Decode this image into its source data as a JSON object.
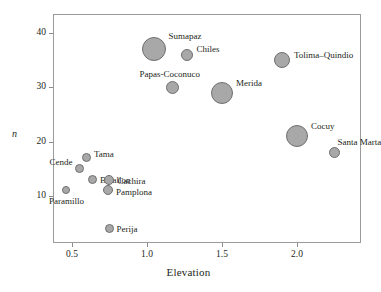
{
  "chart_data": {
    "type": "scatter",
    "title": "",
    "xlabel": "Elevation",
    "ylabel": "n",
    "xlim": [
      0.3734,
      2.4266
    ],
    "ylim": [
      1.3,
      43.5
    ],
    "xticks": [
      0.5,
      1.0,
      1.5,
      2.0
    ],
    "xtick_labels": [
      "0.5",
      "1.0",
      "1.5",
      "2.0"
    ],
    "yticks": [
      10,
      20,
      30,
      40
    ],
    "ytick_labels": [
      "10",
      "20",
      "30",
      "40"
    ],
    "grid": false,
    "legend": "none",
    "marker": "bubble",
    "size_encodes": "bubble area",
    "points": [
      {
        "label": "Sumapaz",
        "x": 1.05,
        "y": 37,
        "size": 24,
        "label_dx": 14,
        "label_dy": -17
      },
      {
        "label": "Chiles",
        "x": 1.27,
        "y": 36,
        "size": 12,
        "label_dx": 9,
        "label_dy": -10
      },
      {
        "label": "Papas-Coconuco",
        "x": 1.17,
        "y": 30,
        "size": 13,
        "label_dx": -33,
        "label_dy": -17
      },
      {
        "label": "Merida",
        "x": 1.5,
        "y": 29,
        "size": 22,
        "label_dx": 14,
        "label_dy": -14
      },
      {
        "label": "Tolima–Quindio",
        "x": 1.9,
        "y": 35,
        "size": 16,
        "label_dx": 12,
        "label_dy": -9
      },
      {
        "label": "Cocuy",
        "x": 2.0,
        "y": 21,
        "size": 22,
        "label_dx": 14,
        "label_dy": -14
      },
      {
        "label": "Santa Marta",
        "x": 2.25,
        "y": 18,
        "size": 11,
        "label_dx": 3,
        "label_dy": -14
      },
      {
        "label": "Tama",
        "x": 0.6,
        "y": 17,
        "size": 9,
        "label_dx": 7,
        "label_dy": -8
      },
      {
        "label": "Cende",
        "x": 0.55,
        "y": 15,
        "size": 9,
        "label_dx": -30,
        "label_dy": -11
      },
      {
        "label": "Batallon",
        "x": 0.64,
        "y": 13,
        "size": 9,
        "label_dx": 7,
        "label_dy": -4
      },
      {
        "label": "Cachira",
        "x": 0.75,
        "y": 13,
        "size": 10,
        "label_dx": 8,
        "label_dy": -3
      },
      {
        "label": "Pamplona",
        "x": 0.74,
        "y": 11,
        "size": 10,
        "label_dx": 8,
        "label_dy": -2
      },
      {
        "label": "Paramillo",
        "x": 0.46,
        "y": 11,
        "size": 8,
        "label_dx": -17,
        "label_dy": 7
      },
      {
        "label": "Perija",
        "x": 0.75,
        "y": 4,
        "size": 9,
        "label_dx": 7,
        "label_dy": -3
      }
    ]
  },
  "axis": {
    "x_title": "Elevation",
    "y_title": "n"
  },
  "colors": {
    "bubble_fill": "#a8a8a8",
    "bubble_stroke": "#6f6f6f",
    "frame": "#9a9a9a",
    "text": "#231f20"
  }
}
